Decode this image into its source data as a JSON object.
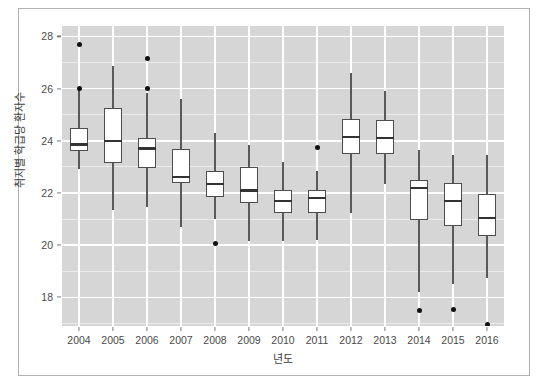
{
  "chart_data": {
    "type": "box",
    "title": "",
    "xlabel": "년도",
    "ylabel": "취지별 학급당 환자수",
    "categories": [
      "2004",
      "2005",
      "2006",
      "2007",
      "2008",
      "2009",
      "2010",
      "2011",
      "2012",
      "2013",
      "2014",
      "2015",
      "2016"
    ],
    "ylim": [
      16.9,
      28.4
    ],
    "xlim_note": "categorical, 13 year groups",
    "y_ticks": [
      18,
      20,
      22,
      24,
      26,
      28
    ],
    "y_tick_labels": [
      "18",
      "20",
      "22",
      "24",
      "26",
      "28"
    ],
    "x_ticks": [
      "2004",
      "2005",
      "2006",
      "2007",
      "2008",
      "2009",
      "2010",
      "2011",
      "2012",
      "2013",
      "2014",
      "2015",
      "2016"
    ],
    "grid": "major white gridlines on grey panel, minor gridlines between",
    "legend": "none",
    "legend_position": "none",
    "boxes": [
      {
        "category": "2004",
        "whisker_low": 22.9,
        "q1": 23.6,
        "median": 23.85,
        "q3": 24.5,
        "whisker_high": 25.95,
        "outliers": [
          26.0,
          27.7
        ]
      },
      {
        "category": "2005",
        "whisker_low": 21.35,
        "q1": 23.15,
        "median": 24.0,
        "q3": 25.25,
        "whisker_high": 26.85,
        "outliers": []
      },
      {
        "category": "2006",
        "whisker_low": 21.45,
        "q1": 22.95,
        "median": 23.7,
        "q3": 24.1,
        "whisker_high": 25.85,
        "outliers": [
          26.0,
          27.15
        ]
      },
      {
        "category": "2007",
        "whisker_low": 20.7,
        "q1": 22.4,
        "median": 22.6,
        "q3": 23.7,
        "whisker_high": 25.6,
        "outliers": []
      },
      {
        "category": "2008",
        "whisker_low": 21.0,
        "q1": 21.85,
        "median": 22.35,
        "q3": 22.85,
        "whisker_high": 24.3,
        "outliers": [
          20.05
        ]
      },
      {
        "category": "2009",
        "whisker_low": 20.15,
        "q1": 21.6,
        "median": 22.1,
        "q3": 23.0,
        "whisker_high": 23.85,
        "outliers": []
      },
      {
        "category": "2010",
        "whisker_low": 20.15,
        "q1": 21.25,
        "median": 21.7,
        "q3": 22.1,
        "whisker_high": 23.2,
        "outliers": []
      },
      {
        "category": "2011",
        "whisker_low": 20.2,
        "q1": 21.25,
        "median": 21.8,
        "q3": 22.1,
        "whisker_high": 22.85,
        "outliers": [
          23.75
        ]
      },
      {
        "category": "2012",
        "whisker_low": 21.25,
        "q1": 23.5,
        "median": 24.15,
        "q3": 24.85,
        "whisker_high": 26.6,
        "outliers": []
      },
      {
        "category": "2013",
        "whisker_low": 22.35,
        "q1": 23.5,
        "median": 24.1,
        "q3": 24.8,
        "whisker_high": 25.9,
        "outliers": []
      },
      {
        "category": "2014",
        "whisker_low": 18.2,
        "q1": 20.95,
        "median": 22.2,
        "q3": 22.5,
        "whisker_high": 23.65,
        "outliers": [
          17.5
        ]
      },
      {
        "category": "2015",
        "whisker_low": 18.5,
        "q1": 20.75,
        "median": 21.7,
        "q3": 22.4,
        "whisker_high": 23.45,
        "outliers": [
          17.55
        ]
      },
      {
        "category": "2016",
        "whisker_low": 18.75,
        "q1": 20.35,
        "median": 21.05,
        "q3": 21.95,
        "whisker_high": 23.45,
        "outliers": [
          16.95
        ]
      }
    ]
  },
  "colors": {
    "panel_background": "#d6d6d6",
    "gridline": "#ffffff",
    "box_fill": "#ffffff",
    "box_border": "#4d4d4d",
    "median_line": "#333333",
    "whisker": "#595959",
    "outlier": "#111111",
    "text": "#4a4a4a",
    "frame_border": "#b0b0b0"
  }
}
